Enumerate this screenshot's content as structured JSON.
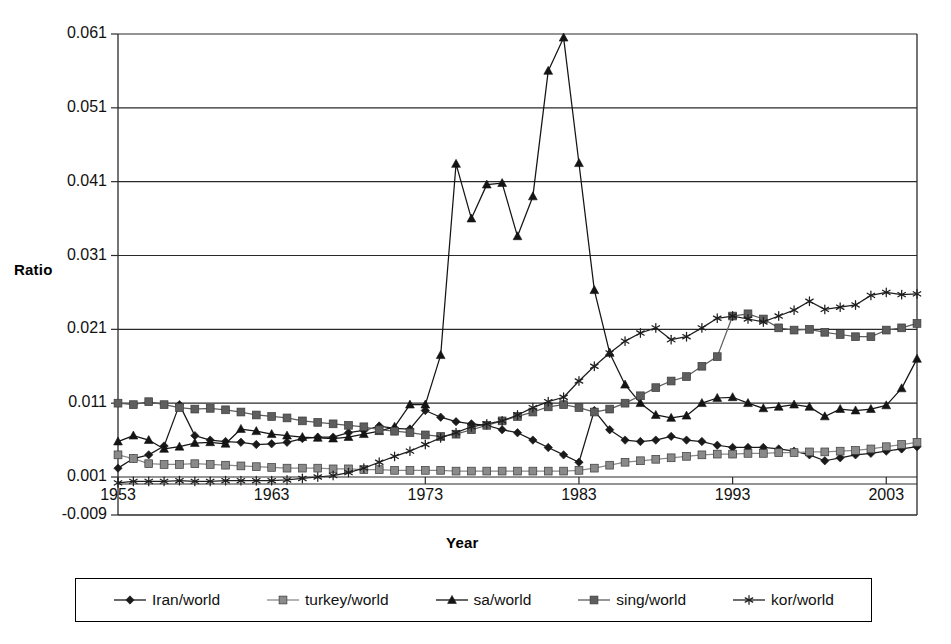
{
  "chart_data": {
    "type": "line",
    "title": "",
    "xlabel": "Year",
    "ylabel": "Ratio",
    "xlim": [
      1953,
      2005
    ],
    "ylim": [
      -0.009,
      0.061
    ],
    "grid": true,
    "legend_position": "bottom",
    "y_ticks": [
      "0.061",
      "0.051",
      "0.041",
      "0.031",
      "0.021",
      "0.011",
      "0.001",
      "-0.009"
    ],
    "y_tick_values": [
      0.061,
      0.051,
      0.041,
      0.031,
      0.021,
      0.011,
      0.001,
      -0.009
    ],
    "x_ticks": [
      "1953",
      "1963",
      "1973",
      "1983",
      "1993",
      "2003"
    ],
    "x_tick_values": [
      1953,
      1963,
      1973,
      1983,
      1993,
      2003
    ],
    "x": [
      1953,
      1954,
      1955,
      1956,
      1957,
      1958,
      1959,
      1960,
      1961,
      1962,
      1963,
      1964,
      1965,
      1966,
      1967,
      1968,
      1969,
      1970,
      1971,
      1972,
      1973,
      1974,
      1975,
      1976,
      1977,
      1978,
      1979,
      1980,
      1981,
      1982,
      1983,
      1984,
      1985,
      1986,
      1987,
      1988,
      1989,
      1990,
      1991,
      1992,
      1993,
      1994,
      1995,
      1996,
      1997,
      1998,
      1999,
      2000,
      2001,
      2002,
      2003,
      2004,
      2005
    ],
    "series": [
      {
        "name": "Iran/world",
        "marker": "diamond",
        "color": "#1a1a1a",
        "values": [
          0.0022,
          0.0035,
          0.004,
          0.0052,
          0.0108,
          0.0066,
          0.006,
          0.0058,
          0.0057,
          0.0054,
          0.0055,
          0.0057,
          0.0062,
          0.0064,
          0.0064,
          0.007,
          0.0073,
          0.0079,
          0.0076,
          0.0075,
          0.01,
          0.0091,
          0.0085,
          0.0082,
          0.008,
          0.0074,
          0.007,
          0.006,
          0.005,
          0.004,
          0.003,
          0.01,
          0.0074,
          0.006,
          0.0058,
          0.006,
          0.0065,
          0.006,
          0.0058,
          0.0053,
          0.005,
          0.005,
          0.005,
          0.0048,
          0.0045,
          0.004,
          0.0032,
          0.0036,
          0.004,
          0.0042,
          0.0045,
          0.0048,
          0.0051
        ]
      },
      {
        "name": "turkey/world",
        "marker": "square",
        "color": "#8a8a8a",
        "values": [
          0.004,
          0.0035,
          0.0028,
          0.0027,
          0.0027,
          0.0028,
          0.0027,
          0.0026,
          0.0025,
          0.0024,
          0.0023,
          0.0022,
          0.0022,
          0.0022,
          0.0021,
          0.0021,
          0.002,
          0.002,
          0.0019,
          0.0019,
          0.0019,
          0.0019,
          0.0018,
          0.0018,
          0.0018,
          0.0018,
          0.0018,
          0.0018,
          0.0018,
          0.0018,
          0.0019,
          0.0022,
          0.0026,
          0.003,
          0.0032,
          0.0034,
          0.0036,
          0.0038,
          0.004,
          0.0041,
          0.0041,
          0.0042,
          0.0042,
          0.0043,
          0.0043,
          0.0044,
          0.0044,
          0.0045,
          0.0046,
          0.0048,
          0.0051,
          0.0054,
          0.0057
        ]
      },
      {
        "name": "sa/world",
        "marker": "triangle",
        "color": "#141414",
        "values": [
          0.0058,
          0.0066,
          0.006,
          0.0048,
          0.0051,
          0.0056,
          0.0057,
          0.0055,
          0.0075,
          0.0072,
          0.0068,
          0.0066,
          0.0064,
          0.0063,
          0.0062,
          0.0064,
          0.0068,
          0.0072,
          0.0078,
          0.0108,
          0.0108,
          0.0175,
          0.0434,
          0.036,
          0.0406,
          0.0408,
          0.0336,
          0.039,
          0.056,
          0.0605,
          0.0435,
          0.0263,
          0.0178,
          0.0135,
          0.011,
          0.0094,
          0.009,
          0.0093,
          0.011,
          0.0117,
          0.0118,
          0.011,
          0.0103,
          0.0105,
          0.0108,
          0.0105,
          0.0092,
          0.0102,
          0.01,
          0.0102,
          0.0107,
          0.013,
          0.017
        ]
      },
      {
        "name": "sing/world",
        "marker": "square",
        "color": "#5e5e5e",
        "values": [
          0.011,
          0.0108,
          0.0112,
          0.0108,
          0.0104,
          0.0102,
          0.0103,
          0.0101,
          0.0098,
          0.0094,
          0.0092,
          0.009,
          0.0086,
          0.0084,
          0.0082,
          0.008,
          0.0078,
          0.0074,
          0.0072,
          0.007,
          0.0067,
          0.0065,
          0.0068,
          0.0074,
          0.008,
          0.0086,
          0.0092,
          0.0098,
          0.0105,
          0.0108,
          0.0104,
          0.0098,
          0.0102,
          0.011,
          0.012,
          0.0131,
          0.014,
          0.0146,
          0.016,
          0.0173,
          0.0228,
          0.0231,
          0.0224,
          0.0212,
          0.0209,
          0.021,
          0.0206,
          0.0203,
          0.02,
          0.02,
          0.0209,
          0.0212,
          0.0218
        ]
      },
      {
        "name": "kor/world",
        "marker": "asterisk",
        "color": "#1f1f1f",
        "values": [
          0.0002,
          0.0004,
          0.0004,
          0.0004,
          0.0005,
          0.0004,
          0.0004,
          0.0005,
          0.0005,
          0.0005,
          0.0005,
          0.0006,
          0.0008,
          0.001,
          0.0012,
          0.0016,
          0.0022,
          0.003,
          0.0038,
          0.0045,
          0.0054,
          0.0063,
          0.007,
          0.0078,
          0.0082,
          0.0086,
          0.0094,
          0.0104,
          0.0112,
          0.0118,
          0.014,
          0.016,
          0.0178,
          0.0194,
          0.0205,
          0.0212,
          0.0196,
          0.02,
          0.0212,
          0.0225,
          0.0228,
          0.0224,
          0.022,
          0.0228,
          0.0236,
          0.0248,
          0.0237,
          0.024,
          0.0243,
          0.0256,
          0.026,
          0.0257,
          0.0258
        ]
      }
    ]
  },
  "legend": {
    "items": [
      {
        "label": "Iran/world",
        "marker": "diamond",
        "color": "#1a1a1a"
      },
      {
        "label": "turkey/world",
        "marker": "square",
        "color": "#8a8a8a"
      },
      {
        "label": "sa/world",
        "marker": "triangle",
        "color": "#141414"
      },
      {
        "label": "sing/world",
        "marker": "square",
        "color": "#5e5e5e"
      },
      {
        "label": "kor/world",
        "marker": "asterisk",
        "color": "#1f1f1f"
      }
    ]
  }
}
